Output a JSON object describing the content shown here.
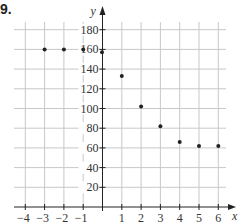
{
  "problem_number": "9.",
  "chart_data": {
    "type": "scatter",
    "title": "",
    "xlabel": "x",
    "ylabel": "y",
    "xlim": [
      -4,
      6
    ],
    "ylim": [
      0,
      180
    ],
    "grid": true,
    "x_ticks": [
      -4,
      -3,
      -2,
      -1,
      1,
      2,
      3,
      4,
      5,
      6
    ],
    "x_tick_labels": [
      "−4",
      "−3",
      "−2",
      "−1",
      "1",
      "2",
      "3",
      "4",
      "5",
      "6"
    ],
    "y_ticks": [
      20,
      40,
      60,
      80,
      100,
      120,
      140,
      160,
      180
    ],
    "y_tick_labels": [
      "20",
      "40",
      "60",
      "80",
      "100",
      "120",
      "140",
      "160",
      "180"
    ],
    "series": [
      {
        "name": "points",
        "x": [
          -3,
          -2,
          -1,
          0,
          1,
          2,
          3,
          4,
          5,
          6
        ],
        "y": [
          160,
          160,
          160,
          157,
          133,
          102,
          82,
          66,
          62,
          62
        ]
      }
    ],
    "colors": {
      "grid": "#c8c8c8",
      "axis": "#222222",
      "point": "#222222"
    }
  }
}
